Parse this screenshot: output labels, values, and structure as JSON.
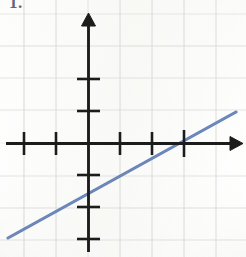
{
  "problem": {
    "number": "1."
  },
  "colors": {
    "line": "#5c7ab2",
    "axis": "#1b1b1b",
    "grid": "#d9dbd6",
    "paper": "#fdfdfc",
    "label": "#4b4f72"
  },
  "chart_data": {
    "type": "line",
    "title": "",
    "subtitle": "",
    "xlabel": "",
    "ylabel": "",
    "xlim": [
      -2.75,
      4.9
    ],
    "ylim": [
      -3.5,
      2.6
    ],
    "grid": true,
    "grid_spacing": 1,
    "legend": null,
    "axes": {
      "origin_px": [
        88,
        143
      ],
      "unit_px": 32,
      "x_axis_arrow": "right",
      "y_axis_arrow": "up",
      "x_ticks": [
        -2,
        -1,
        1,
        2,
        3
      ],
      "y_ticks": [
        2,
        1,
        -1,
        -2,
        -3
      ],
      "tick_labels_shown": false
    },
    "series": [
      {
        "name": "line",
        "color": "#5c7ab2",
        "slope": 0.54,
        "intercept": -1.62,
        "x_intercept": 3,
        "y_intercept": -1.62,
        "equation": "y = 0.54x - 1.62",
        "points": [
          {
            "x": -2.5,
            "y": -2.97
          },
          {
            "x": 4.6,
            "y": 0.87
          }
        ],
        "endpoints_px": [
          [
            8,
            238
          ],
          [
            236,
            112
          ]
        ]
      }
    ],
    "gridlines_px": {
      "vertical": [
        24,
        56,
        88,
        120,
        152,
        184,
        216
      ],
      "horizontal": [
        46,
        78,
        110,
        143,
        176,
        208,
        240
      ]
    }
  }
}
